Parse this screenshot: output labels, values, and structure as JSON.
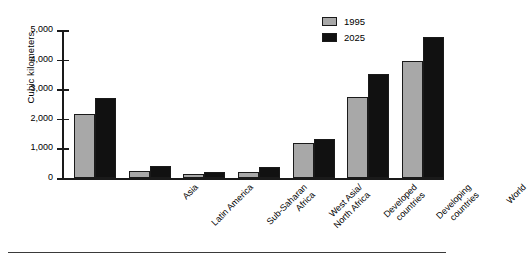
{
  "chart_data": {
    "type": "bar",
    "title": "",
    "xlabel": "",
    "ylabel": "Cubic kilometers",
    "ylim": [
      0,
      5000
    ],
    "ytick_labels": [
      "5,000",
      "4,000",
      "3,000",
      "2,000",
      "1,000",
      "0"
    ],
    "ytick_values": [
      5000,
      4000,
      3000,
      2000,
      1000,
      0
    ],
    "grid": false,
    "legend_position": "top-right",
    "categories": [
      "Asia",
      "Latin America",
      "Sub-Saharan\nAfrica",
      "West Asia/\nNorth Africa",
      "Developed\ncountries",
      "Developing\ncountries",
      "World"
    ],
    "series": [
      {
        "name": "1995",
        "color": "#a8a8a8",
        "values": [
          2160,
          250,
          130,
          190,
          1180,
          2740,
          3950
        ]
      },
      {
        "name": "2025",
        "color": "#111111",
        "values": [
          2700,
          420,
          200,
          360,
          1320,
          3520,
          4760
        ]
      }
    ]
  },
  "legend": {
    "items": [
      {
        "label": "1995"
      },
      {
        "label": "2025"
      }
    ]
  },
  "colors": {
    "series_1995": "#a8a8a8",
    "series_2025": "#111111",
    "axis": "#1a1a1a",
    "background": "#ffffff"
  }
}
